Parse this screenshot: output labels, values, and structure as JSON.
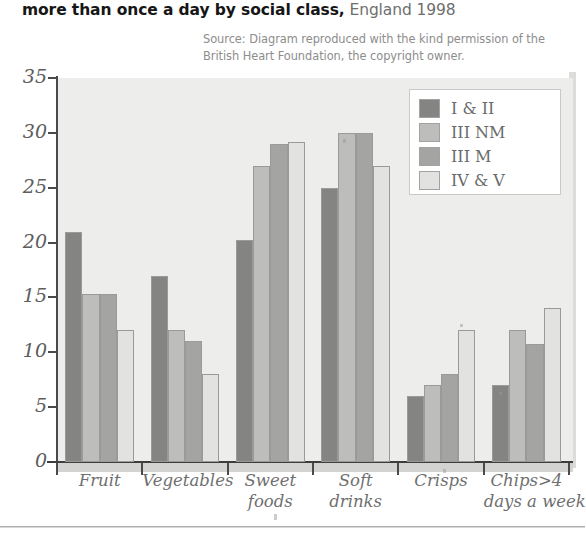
{
  "title": {
    "strong": "more than once a day by social class,",
    "light": " England 1998"
  },
  "source": {
    "line1": "Source: Diagram reproduced with the kind permission of the",
    "line2": "British Heart Foundation, the copyright owner."
  },
  "legend": {
    "items": [
      {
        "label": "I & II",
        "color": "#848482"
      },
      {
        "label": "III NM",
        "color": "#bdbdbb"
      },
      {
        "label": "III M",
        "color": "#a4a4a2"
      },
      {
        "label": "IV & V",
        "color": "#e2e2e0"
      }
    ]
  },
  "axis": {
    "y_ticks": [
      "0",
      "5",
      "10",
      "15",
      "20",
      "25",
      "30",
      "35"
    ],
    "y_min": 0,
    "y_max": 35,
    "x_categories": [
      {
        "lines": [
          "Fruit"
        ]
      },
      {
        "lines": [
          "Vegetables"
        ]
      },
      {
        "lines": [
          "Sweet",
          "foods"
        ]
      },
      {
        "lines": [
          "Soft",
          "drinks"
        ]
      },
      {
        "lines": [
          "Crisps"
        ]
      },
      {
        "lines": [
          "Chips>4",
          "days a week"
        ]
      }
    ]
  },
  "chart_data": {
    "type": "bar",
    "title": "more than once a day by social class, England 1998",
    "xlabel": "",
    "ylabel": "",
    "ylim": [
      0,
      35
    ],
    "yticks": [
      0,
      5,
      10,
      15,
      20,
      25,
      30,
      35
    ],
    "grid": false,
    "legend_position": "top-right",
    "note": "Source: Diagram reproduced with the kind permission of the British Heart Foundation, the copyright owner.",
    "categories": [
      "Fruit",
      "Vegetables",
      "Sweet foods",
      "Soft drinks",
      "Crisps",
      "Chips>4 days a week"
    ],
    "series": [
      {
        "name": "I & II",
        "color": "#848482",
        "values": [
          21,
          17,
          20.2,
          25,
          6,
          7
        ]
      },
      {
        "name": "III NM",
        "color": "#bdbdbb",
        "values": [
          15.3,
          12,
          27,
          30,
          7,
          12
        ]
      },
      {
        "name": "III M",
        "color": "#a4a4a2",
        "values": [
          15.3,
          11,
          29,
          30,
          8,
          10.8
        ]
      },
      {
        "name": "IV & V",
        "color": "#e2e2e0",
        "values": [
          12,
          8,
          29.2,
          27,
          12,
          14
        ]
      }
    ]
  }
}
